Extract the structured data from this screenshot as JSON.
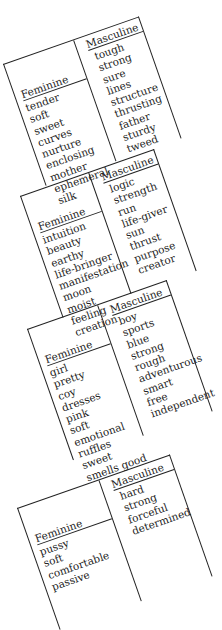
{
  "cropped_text": "··· ···",
  "tables": [
    {
      "feminine_header": "Feminine",
      "masculine_header": "Masculine",
      "feminine": [
        "tender",
        "soft",
        "sweet",
        "curves",
        "nurture",
        "enclosing",
        "mother",
        "ephemeral",
        "silk"
      ],
      "masculine": [
        "tough",
        "strong",
        "sure",
        "lines",
        "structure",
        "thrusting",
        "father",
        "sturdy",
        "tweed"
      ]
    },
    {
      "feminine_header": "Feminine",
      "masculine_header": "Masculine",
      "feminine": [
        "intuition",
        "beauty",
        "earthy",
        "life-bringer",
        "manifestation",
        "moon",
        "moist",
        "feeling",
        "creation"
      ],
      "masculine": [
        "logic",
        "strength",
        "run",
        "life-giver",
        "sun",
        "thrust",
        "purpose",
        "creator"
      ]
    },
    {
      "feminine_header": "Feminine",
      "masculine_header": "Masculine",
      "feminine": [
        "girl",
        "pretty",
        "coy",
        "dresses",
        "pink",
        "soft",
        "emotional",
        "ruffles",
        "sweet",
        "smells good"
      ],
      "masculine": [
        "boy",
        "sports",
        "blue",
        "strong",
        "rough",
        "adventurous",
        "smart",
        "free",
        "independent"
      ]
    },
    {
      "feminine_header": "Feminine",
      "masculine_header": "Masculine",
      "feminine": [
        "pussy",
        "soft",
        "comfortable",
        "passive"
      ],
      "masculine": [
        "hard",
        "strong",
        "forceful",
        "determined"
      ]
    }
  ]
}
